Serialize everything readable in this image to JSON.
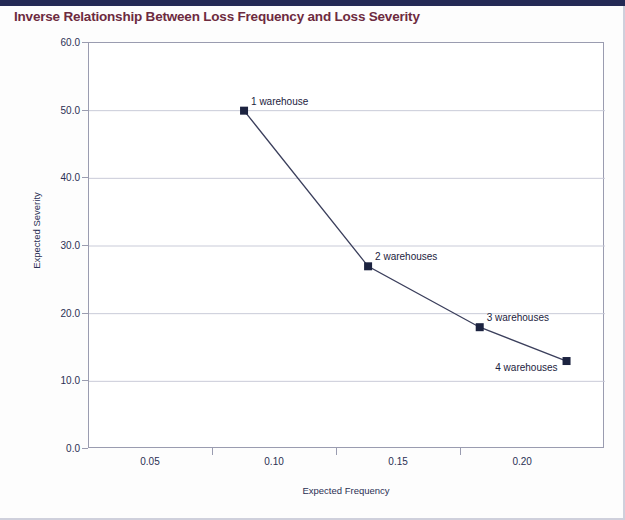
{
  "chart_data": {
    "type": "line",
    "title": "Inverse Relationship Between Loss Frequency and Loss Severity",
    "xlabel": "Expected Frequency",
    "ylabel": "Expected Severity",
    "xlim": [
      0.025,
      0.233
    ],
    "ylim": [
      0.0,
      60.0
    ],
    "xticks": [
      "0.05",
      "0.10",
      "0.15",
      "0.20"
    ],
    "xtick_values": [
      0.05,
      0.1,
      0.15,
      0.2
    ],
    "yticks": [
      "0.0",
      "10.0",
      "20.0",
      "30.0",
      "40.0",
      "50.0",
      "60.0"
    ],
    "ytick_values": [
      0.0,
      10.0,
      20.0,
      30.0,
      40.0,
      50.0,
      60.0
    ],
    "grid": "horizontal",
    "legend": "none",
    "marker": "square",
    "series": [
      {
        "name": "Expected Severity",
        "x": [
          0.0875,
          0.1375,
          0.1825,
          0.2175
        ],
        "y": [
          50.0,
          27.0,
          18.0,
          13.0
        ],
        "point_labels": [
          "1 warehouse",
          "2 warehouses",
          "3 warehouses",
          "4 warehouses"
        ],
        "label_side": [
          "right",
          "right",
          "right",
          "left"
        ]
      }
    ]
  },
  "colors": {
    "title": "#6d2b3f",
    "axis": "#9a9cb0",
    "grid": "#c9cbd8",
    "line": "#3b3f5c",
    "marker": "#1c2340",
    "tick_text": "#2b3054",
    "top_rule": "#242a55"
  }
}
